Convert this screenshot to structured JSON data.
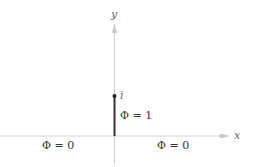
{
  "diagram": {
    "axes": {
      "x_label": "x",
      "y_label": "y"
    },
    "point": {
      "label": "i"
    },
    "regions": {
      "segment_label": "Φ = 1",
      "left_label": "Φ = 0",
      "right_label": "Φ = 0"
    },
    "colors": {
      "axis": "#c8c8c8",
      "segment": "#333333",
      "text": "#333333"
    }
  }
}
